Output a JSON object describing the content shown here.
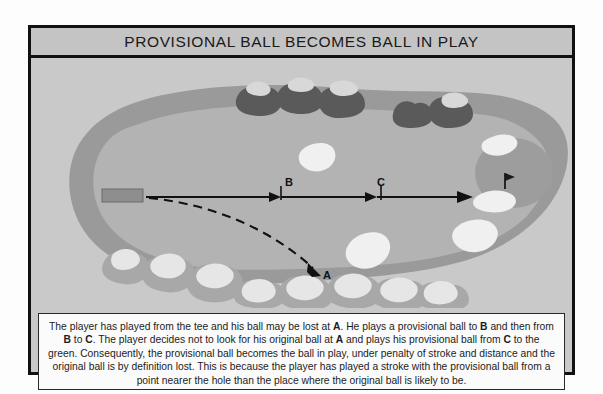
{
  "page": {
    "width": 603,
    "height": 394,
    "background_color": "#fdfdfd"
  },
  "title_bar": {
    "title": "PROVISIONAL BALL BECOMES BALL IN PLAY",
    "background_color": "#c4c4c4",
    "text_color": "#1a1a1a"
  },
  "illustration": {
    "name": "golf-hole-diagram",
    "colors": {
      "background_grass": "#c9c9c9",
      "rough": "#9a9a9a",
      "fairway": "#b3b3b3",
      "green": "#9d9d9d",
      "bunker_sand": "#f0f0f0",
      "tree_dark": "#5a5a5a",
      "tree_light": "#d8d8d8",
      "tree_mid": "#a8a8a8",
      "line": "#111111",
      "tee_box": "#8e8e8e"
    },
    "markers": [
      {
        "id": "A",
        "label": "A",
        "x": 318,
        "y": 246,
        "description": "original ball likely lost"
      },
      {
        "id": "B",
        "label": "B",
        "x": 272,
        "y": 160,
        "description": "provisional ball first shot"
      },
      {
        "id": "C",
        "label": "C",
        "x": 377,
        "y": 160,
        "description": "provisional ball second shot"
      }
    ],
    "tee_box_label": "tee",
    "flag_label": "pin",
    "solid_line_description": "provisional ball path from tee to B to C to green",
    "dashed_line_description": "original ball path from tee curving to A"
  },
  "caption": {
    "line1_pre": "The player has played from the tee and his ball may be lost at ",
    "mark_a_1": "A",
    "line1_mid": ". He plays a provisional ball to ",
    "mark_b_1": "B",
    "line1_post": " and then from ",
    "mark_b_2": "B",
    "line2_mid1": " to ",
    "mark_c_1": "C",
    "line2_mid2": ". The player decides not to look for his original ball at ",
    "mark_a_2": "A",
    "line2_mid3": " and plays his provisional ball from ",
    "mark_c_2": "C",
    "line2_end": " to the green.  Consequently, the provisional ball becomes the ball in play, under penalty of stroke and distance and the original ball is by definition lost. This is because the player has played a stroke with the provisional ball from a point nearer the hole than the place where the original ball is likely to be."
  }
}
